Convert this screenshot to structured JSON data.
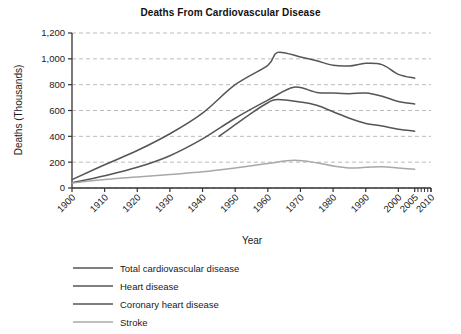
{
  "chart_data": {
    "type": "line",
    "title": "Deaths From Cardiovascular Disease",
    "xlabel": "Year",
    "ylabel": "Deaths (Thousands)",
    "xlim": [
      1900,
      2010
    ],
    "ylim": [
      0,
      1200
    ],
    "grid": true,
    "grid_style": "dashed-horizontal",
    "legend_position": "below",
    "y_ticks": [
      0,
      200,
      400,
      600,
      800,
      1000,
      1200
    ],
    "y_tick_labels": [
      "0",
      "200",
      "400",
      "600",
      "800",
      "1,000",
      "1,200"
    ],
    "x_ticks": [
      1900,
      1910,
      1920,
      1930,
      1940,
      1950,
      1960,
      1970,
      1980,
      1990,
      2000,
      2005,
      2010
    ],
    "x_tick_labels": [
      "1900",
      "1910",
      "1920",
      "1930",
      "1940",
      "1950",
      "1960",
      "1970",
      "1980",
      "1990",
      "2000",
      "2005",
      "2010"
    ],
    "series": [
      {
        "name": "Total cardiovascular disease",
        "color": "#555555",
        "x": [
          1900,
          1910,
          1920,
          1930,
          1940,
          1950,
          1960,
          1963,
          1970,
          1975,
          1980,
          1985,
          1990,
          1995,
          2000,
          2005
        ],
        "values": [
          65,
          180,
          290,
          420,
          580,
          800,
          950,
          1050,
          1015,
          985,
          950,
          945,
          965,
          955,
          880,
          850
        ]
      },
      {
        "name": "Heart disease",
        "color": "#555555",
        "x": [
          1900,
          1910,
          1920,
          1930,
          1940,
          1950,
          1960,
          1968,
          1975,
          1980,
          1985,
          1990,
          1995,
          2000,
          2005
        ],
        "values": [
          40,
          95,
          160,
          250,
          380,
          540,
          680,
          780,
          740,
          735,
          730,
          735,
          710,
          670,
          650
        ]
      },
      {
        "name": "Coronary heart disease",
        "color": "#555555",
        "x": [
          1945,
          1950,
          1955,
          1960,
          1963,
          1970,
          1975,
          1980,
          1985,
          1990,
          1995,
          2000,
          2005
        ],
        "values": [
          400,
          490,
          580,
          660,
          685,
          665,
          640,
          590,
          540,
          500,
          480,
          455,
          440
        ]
      },
      {
        "name": "Stroke",
        "color": "#a8a8a8",
        "x": [
          1900,
          1910,
          1920,
          1930,
          1940,
          1950,
          1960,
          1968,
          1975,
          1980,
          1985,
          1990,
          1995,
          2000,
          2005
        ],
        "values": [
          38,
          65,
          85,
          105,
          125,
          155,
          190,
          215,
          195,
          170,
          155,
          160,
          165,
          155,
          145
        ]
      }
    ],
    "legend": [
      {
        "label": "Total cardiovascular disease",
        "color": "#555555"
      },
      {
        "label": "Heart disease",
        "color": "#555555"
      },
      {
        "label": "Coronary heart disease",
        "color": "#555555"
      },
      {
        "label": "Stroke",
        "color": "#a8a8a8"
      }
    ]
  }
}
